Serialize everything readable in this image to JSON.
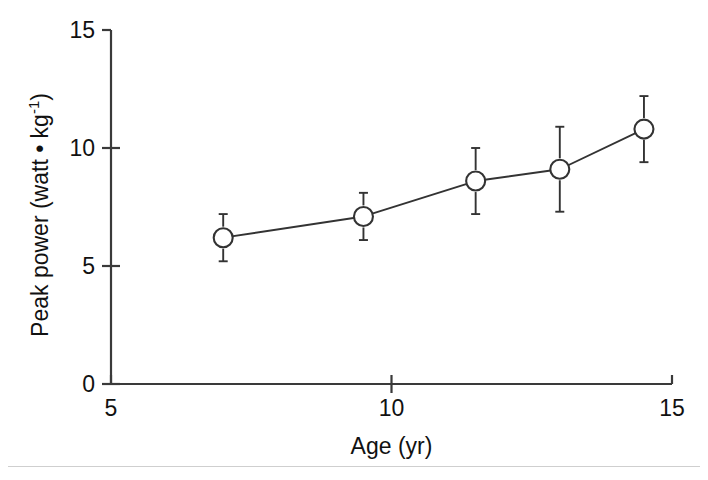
{
  "figure": {
    "background": "#ffffff",
    "line_color": "#333333",
    "axis_color": "#3a3a3a",
    "text_color": "#111111",
    "marker_fill": "#ffffff",
    "rule_color": "#cfcfcf"
  },
  "axes": {
    "x": {
      "title": "Age (yr)",
      "ticks": [
        {
          "value": 5,
          "label": "5"
        },
        {
          "value": 10,
          "label": "10"
        },
        {
          "value": 15,
          "label": "15"
        }
      ],
      "min": 5,
      "max": 15
    },
    "y": {
      "title_main": "Peak power (watt • kg",
      "title_sup": "-1",
      "title_tail": ")",
      "title_full": "Peak power (watt • kg-1)",
      "ticks": [
        {
          "value": 0,
          "label": "0"
        },
        {
          "value": 5,
          "label": "5"
        },
        {
          "value": 10,
          "label": "10"
        },
        {
          "value": 15,
          "label": "15"
        }
      ],
      "min": 0,
      "max": 15
    }
  },
  "chart_data": {
    "type": "line",
    "title": "",
    "subtitle": "",
    "xlabel": "Age (yr)",
    "ylabel": "Peak power (watt • kg-1)",
    "xlim": [
      5,
      15
    ],
    "ylim": [
      0,
      15
    ],
    "xticks": [
      5,
      10,
      15
    ],
    "yticks": [
      0,
      5,
      10,
      15
    ],
    "grid": false,
    "legend": false,
    "legend_position": "none",
    "marker": "open-circle",
    "error_bars": "symmetric-vertical",
    "x": [
      7.0,
      9.5,
      11.5,
      13.0,
      14.5
    ],
    "y": [
      6.2,
      7.1,
      8.6,
      9.1,
      10.8
    ],
    "yerr": [
      1.0,
      1.0,
      1.4,
      1.8,
      1.4
    ],
    "series": [
      {
        "name": "Peak power",
        "points": [
          {
            "x": 7.0,
            "y": 6.2,
            "err": 1.0
          },
          {
            "x": 9.5,
            "y": 7.1,
            "err": 1.0
          },
          {
            "x": 11.5,
            "y": 8.6,
            "err": 1.4
          },
          {
            "x": 13.0,
            "y": 9.1,
            "err": 1.8
          },
          {
            "x": 14.5,
            "y": 10.8,
            "err": 1.4
          }
        ]
      }
    ]
  }
}
